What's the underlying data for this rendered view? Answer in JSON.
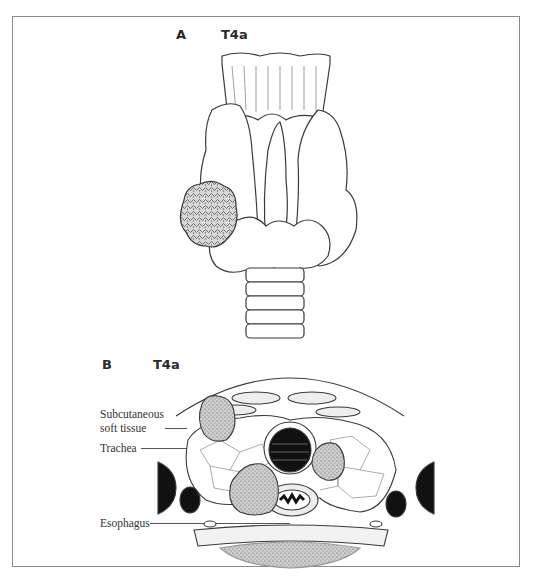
{
  "figure": {
    "panel_a": {
      "letter": "A",
      "stage": "T4a"
    },
    "panel_b": {
      "letter": "B",
      "stage": "T4a",
      "labels": {
        "subcutaneous_line1": "Subcutaneous",
        "subcutaneous_line2": "soft tissue",
        "trachea": "Trachea",
        "esophagus": "Esophagus"
      }
    },
    "colors": {
      "frame": "#8a8a8a",
      "line": "#3a3a3a",
      "tumor_fill": "#9a9a9a",
      "lumen_fill": "#111111"
    }
  }
}
